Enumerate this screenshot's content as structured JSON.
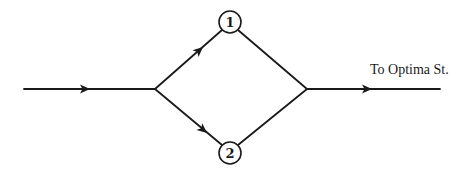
{
  "diagram": {
    "type": "network-flow",
    "nodes": [
      {
        "id": "1",
        "label": "1"
      },
      {
        "id": "2",
        "label": "2"
      }
    ],
    "edges": [
      {
        "from": "input",
        "to": "split-junction",
        "directed": true
      },
      {
        "from": "split-junction",
        "to": "1",
        "directed": true
      },
      {
        "from": "split-junction",
        "to": "2",
        "directed": true
      },
      {
        "from": "1",
        "to": "merge-junction",
        "directed": false
      },
      {
        "from": "2",
        "to": "merge-junction",
        "directed": false
      },
      {
        "from": "merge-junction",
        "to": "output",
        "directed": true
      }
    ],
    "destination_label": "To Optima St.",
    "colors": {
      "stroke": "#1a1a1a",
      "background": "#ffffff"
    }
  }
}
